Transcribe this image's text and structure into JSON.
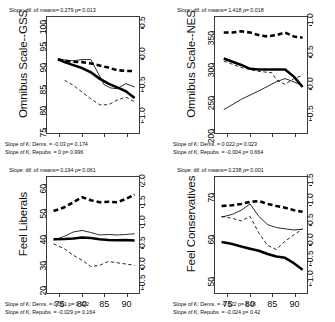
{
  "figure": {
    "background": "#ffffff",
    "panel_count": 4,
    "x_axis": {
      "ticks": [
        75,
        80,
        85,
        90
      ],
      "range": [
        72,
        93
      ],
      "label": ""
    },
    "line_styles": {
      "thick_solid": "All respondents / mean (thick solid black)",
      "thick_dashed": "Thick dashed black series",
      "thin_solid": "Thin solid black series",
      "thin_dashed": "Thin dashed black series"
    },
    "colors": {
      "line": "#000000",
      "axis": "#3a3a3a",
      "text": "#111111"
    }
  },
  "chart_data": [
    {
      "type": "line",
      "panel_id": "omnibus-scale-gss",
      "title": "",
      "ylabel": "Omnibus Scale--GSS",
      "xlabel": "",
      "xlim": [
        72,
        93
      ],
      "ylim": [
        73.5,
        101
      ],
      "yticks": [
        75,
        80,
        85,
        90,
        95,
        100
      ],
      "y2lim": [
        -1.2,
        0.7
      ],
      "y2ticks": [
        0.5,
        0.0,
        -0.5,
        -1.0
      ],
      "y2ticklabels": [
        "0.5",
        "0.0",
        "-0.5",
        "-1.0"
      ],
      "xticks": [
        75,
        80,
        85,
        90
      ],
      "grid": false,
      "legend": "none",
      "annotations": {
        "top": "Slope: dif. of means= 0.279 p=  0.013",
        "bottom_line1": "Slope of K; Dems. = -0.03 p= 0.174",
        "bottom_line2": "Slope of K; Repubs. = 0 p= 0.996"
      },
      "series": [
        {
          "name": "thick-dashed",
          "style": "thick-dashed",
          "x": [
            74.5,
            76,
            78,
            80,
            82,
            84,
            86,
            88,
            90,
            92
          ],
          "values": [
            91.0,
            90.6,
            90.4,
            90.3,
            90.0,
            89.5,
            89.0,
            88.4,
            88.2,
            88.2
          ]
        },
        {
          "name": "thick-solid",
          "style": "thick-solid",
          "x": [
            74.5,
            76,
            78,
            80,
            82,
            84,
            86,
            88,
            90,
            92
          ],
          "values": [
            91.0,
            90.3,
            89.6,
            88.9,
            87.9,
            86.4,
            85.2,
            84.3,
            83.4,
            81.8
          ]
        },
        {
          "name": "thin-solid",
          "style": "thin-solid",
          "x": [
            74.5,
            78,
            80,
            82,
            83.5,
            85,
            86.5,
            88,
            90,
            92
          ],
          "values": [
            91.0,
            90.6,
            90.9,
            90.9,
            88.0,
            85.0,
            84.2,
            84.0,
            85.2,
            84.4
          ]
        },
        {
          "name": "thin-dashed",
          "style": "thin-dashed",
          "x": [
            76,
            78,
            80,
            82,
            84,
            86,
            88,
            90,
            92
          ],
          "values": [
            86.0,
            84.8,
            83.2,
            81.6,
            80.2,
            80.2,
            81.3,
            82.0,
            80.9
          ]
        }
      ]
    },
    {
      "type": "line",
      "panel_id": "omnibus-scale-nes",
      "title": "",
      "ylabel": "Omnibus Scale--NES",
      "xlabel": "",
      "xlim": [
        72,
        93
      ],
      "ylim": [
        193,
        372
      ],
      "yticks": [
        200,
        250,
        300,
        350
      ],
      "y2lim": [
        -0.72,
        1.15
      ],
      "y2ticks": [
        1.0,
        0.5,
        0.0,
        -0.5
      ],
      "y2ticklabels": [
        "1.0",
        "0.5",
        "0.0",
        "-0.5"
      ],
      "xticks": [
        75,
        80,
        85,
        90
      ],
      "grid": false,
      "legend": "none",
      "annotations": {
        "top": "Slope: dif. of means= 1.418 p=  0.018",
        "bottom_line1": "Slope of K; Dems. = 0.022 p= 0.023",
        "bottom_line2": "Slope of K; Repubs. = -0.004 p= 0.664"
      },
      "series": [
        {
          "name": "thick-dashed",
          "style": "thick-dashed",
          "x": [
            74,
            76,
            78,
            80,
            82,
            84,
            86,
            88,
            90,
            92
          ],
          "values": [
            348,
            348,
            350,
            348,
            344,
            342,
            344,
            348,
            342,
            340
          ]
        },
        {
          "name": "thick-solid",
          "style": "thick-solid",
          "x": [
            74,
            76,
            78,
            80,
            82,
            84,
            86,
            88,
            90,
            92
          ],
          "values": [
            308,
            303,
            298,
            292,
            291,
            291,
            291,
            291,
            280,
            264
          ]
        },
        {
          "name": "thin-solid",
          "style": "thin-solid",
          "x": [
            74,
            78,
            82,
            86,
            88,
            90,
            92
          ],
          "values": [
            229,
            245,
            258,
            272,
            277,
            272,
            266
          ]
        },
        {
          "name": "thin-dashed",
          "style": "thin-dashed",
          "x": [
            74,
            78,
            82,
            85,
            86,
            88,
            90,
            92
          ],
          "values": [
            304,
            294,
            288,
            286,
            275,
            268,
            277,
            282
          ]
        }
      ]
    },
    {
      "type": "line",
      "panel_id": "feel-liberals",
      "title": "",
      "ylabel": "Feel Liberals",
      "xlabel": "",
      "xlim": [
        72,
        93
      ],
      "ylim": [
        17,
        63
      ],
      "yticks": [
        20,
        30,
        40,
        50,
        60
      ],
      "y2lim": [
        -0.62,
        2.25
      ],
      "y2ticks": [
        2.0,
        1.5,
        1.0,
        0.5,
        0.0,
        -0.5
      ],
      "y2ticklabels": [
        "2.0",
        "1.5",
        "1.0",
        "0.5",
        "0.0",
        "-0.5"
      ],
      "xticks": [
        75,
        80,
        85,
        90
      ],
      "grid": false,
      "legend": "none",
      "annotations": {
        "top": "Slope: dif. of means= 0.194 p=  0.061",
        "bottom_line1": "Slope of K; Dems. = 0.001 p= 0.922",
        "bottom_line2": "Slope of K; Repubs. = -0.029 p= 0.164"
      },
      "series": [
        {
          "name": "thick-dashed",
          "style": "thick-dashed",
          "x": [
            73.5,
            76,
            78,
            80,
            82,
            84,
            86,
            88,
            90,
            92
          ],
          "values": [
            49.5,
            51.0,
            53.0,
            55.0,
            53.8,
            53.0,
            53.2,
            53.0,
            54.3,
            56.0
          ]
        },
        {
          "name": "thick-solid",
          "style": "thick-solid",
          "x": [
            73.5,
            76,
            78,
            80,
            82,
            84,
            86,
            88,
            90,
            92
          ],
          "values": [
            38.3,
            38.4,
            38.6,
            39.0,
            38.8,
            38.3,
            38.0,
            37.9,
            38.0,
            37.8
          ]
        },
        {
          "name": "thin-solid",
          "style": "thin-solid",
          "x": [
            73.5,
            76,
            78,
            80,
            82,
            84,
            86,
            88,
            90,
            92
          ],
          "values": [
            38.0,
            39.5,
            41.2,
            41.8,
            41.0,
            40.0,
            40.2,
            40.0,
            40.2,
            40.5
          ]
        },
        {
          "name": "thin-dashed",
          "style": "thin-dashed",
          "x": [
            73.5,
            76,
            78,
            80,
            82,
            84,
            86,
            88,
            90,
            92
          ],
          "values": [
            36.5,
            34.5,
            32.0,
            30.0,
            27.5,
            28.0,
            29.5,
            29.0,
            28.5,
            28.0
          ]
        }
      ]
    },
    {
      "type": "line",
      "panel_id": "feel-conservatives",
      "title": "",
      "ylabel": "Feel Conservatives",
      "xlabel": "",
      "xlim": [
        72,
        93
      ],
      "ylim": [
        46,
        74
      ],
      "yticks": [
        50,
        60,
        70
      ],
      "y2lim": [
        -1.22,
        1.72
      ],
      "y2ticks": [
        1.5,
        1.0,
        0.5,
        0.0,
        -0.5,
        -1.0
      ],
      "y2ticklabels": [
        "1.5",
        "1.0",
        "0.5",
        "0.0",
        "-0.5",
        "-1.0"
      ],
      "xticks": [
        75,
        80,
        85,
        90
      ],
      "grid": false,
      "legend": "none",
      "annotations": {
        "top": "Slope: dif. of means= 0.238 p= 0.001",
        "bottom_line1": "Slope of K; Dems. = -0.022 p= 0.18",
        "bottom_line2": "Slope of K; Repubs. = -0.024 p= 0.42"
      },
      "series": [
        {
          "name": "thick-dashed",
          "style": "thick-dashed",
          "x": [
            73.5,
            76,
            78,
            80,
            82,
            84,
            86,
            88,
            90,
            92
          ],
          "values": [
            67.0,
            67.2,
            67.5,
            68.0,
            68.2,
            67.5,
            67.0,
            66.6,
            66.0,
            65.6
          ]
        },
        {
          "name": "thick-solid",
          "style": "thick-solid",
          "x": [
            73.5,
            76,
            78,
            80,
            82,
            84,
            86,
            88,
            90,
            92
          ],
          "values": [
            58.3,
            57.8,
            57.2,
            56.7,
            56.2,
            55.4,
            54.8,
            54.5,
            53.2,
            51.6
          ]
        },
        {
          "name": "thin-solid",
          "style": "thin-solid",
          "x": [
            73.5,
            76,
            78,
            80,
            82,
            84,
            86,
            88,
            90,
            92
          ],
          "values": [
            64.3,
            65.0,
            66.0,
            67.5,
            64.5,
            62.5,
            61.8,
            61.5,
            61.2,
            61.4
          ]
        },
        {
          "name": "thin-dashed",
          "style": "thin-dashed",
          "x": [
            73.5,
            76,
            78,
            80,
            82,
            84,
            86,
            88,
            90,
            92
          ],
          "values": [
            64.5,
            64.0,
            63.4,
            64.5,
            60.5,
            57.5,
            56.5,
            58.5,
            60.0,
            61.5
          ]
        }
      ]
    }
  ]
}
